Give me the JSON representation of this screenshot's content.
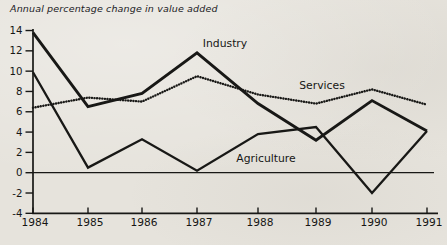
{
  "title": "Annual percentage change in value added",
  "chart_data": {
    "type": "line",
    "title": "Annual percentage change in value added",
    "categories": [
      "1984",
      "1985",
      "1986",
      "1987",
      "1988",
      "1989",
      "1990",
      "1991"
    ],
    "series": [
      {
        "name": "Industry",
        "line_style": "solid-thick",
        "values": [
          13.8,
          6.5,
          7.8,
          11.8,
          6.8,
          3.2,
          7.1,
          4.1
        ]
      },
      {
        "name": "Services",
        "line_style": "dotted",
        "values": [
          6.4,
          7.4,
          7.0,
          9.5,
          7.7,
          6.8,
          8.2,
          6.7
        ]
      },
      {
        "name": "Agriculture",
        "line_style": "solid",
        "values": [
          9.9,
          0.5,
          3.3,
          0.2,
          3.8,
          4.5,
          -2.0,
          4.1
        ]
      }
    ],
    "y_ticks": [
      "14",
      "12",
      "10",
      "8",
      "6",
      "4",
      "2",
      "0",
      "-2",
      "-4"
    ],
    "ylim": [
      -4,
      14
    ],
    "xlabel": "",
    "ylabel": "",
    "grid": false,
    "legend": "inline-labels",
    "zero_line": true,
    "colors": {
      "ink": "#181816",
      "paper": "#e6e3dc"
    }
  }
}
